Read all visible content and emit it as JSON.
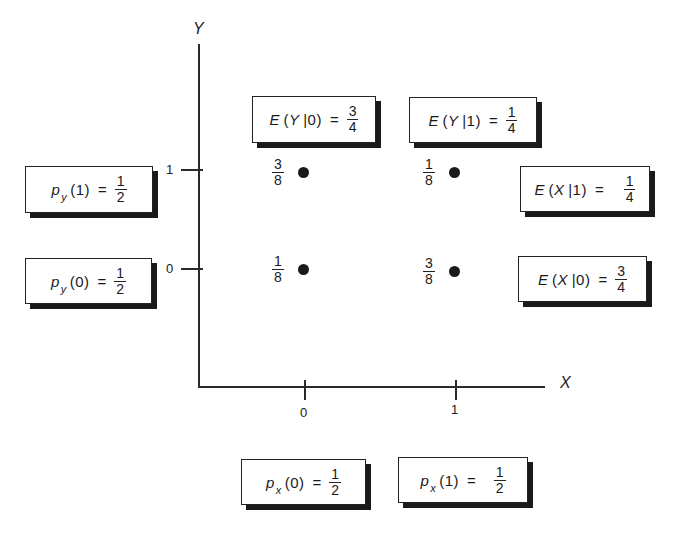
{
  "axes": {
    "x_label": "X",
    "y_label": "Y",
    "x_ticks": [
      "0",
      "1"
    ],
    "y_ticks": [
      "1",
      "0"
    ]
  },
  "points": [
    {
      "x": 0,
      "y": 1,
      "prob_num": "3",
      "prob_den": "8"
    },
    {
      "x": 1,
      "y": 1,
      "prob_num": "1",
      "prob_den": "8"
    },
    {
      "x": 0,
      "y": 0,
      "prob_num": "1",
      "prob_den": "8"
    },
    {
      "x": 1,
      "y": 0,
      "prob_num": "3",
      "prob_den": "8"
    }
  ],
  "boxes": {
    "ey0": {
      "func": "E",
      "var": "Y",
      "cond": "0",
      "num": "3",
      "den": "4"
    },
    "ey1": {
      "func": "E",
      "var": "Y",
      "cond": "1",
      "num": "1",
      "den": "4"
    },
    "ex1": {
      "func": "E",
      "var": "X",
      "cond": "1",
      "num": "1",
      "den": "4"
    },
    "ex0": {
      "func": "E",
      "var": "X",
      "cond": "0",
      "num": "3",
      "den": "4"
    },
    "py1": {
      "func": "p",
      "sub": "y",
      "arg": "1",
      "num": "1",
      "den": "2"
    },
    "py0": {
      "func": "p",
      "sub": "y",
      "arg": "0",
      "num": "1",
      "den": "2"
    },
    "px0": {
      "func": "p",
      "sub": "x",
      "arg": "0",
      "num": "1",
      "den": "2"
    },
    "px1": {
      "func": "p",
      "sub": "x",
      "arg": "1",
      "num": "1",
      "den": "2"
    }
  },
  "symbols": {
    "equals": "=",
    "open": "(",
    "close": ")",
    "bar": "|"
  }
}
